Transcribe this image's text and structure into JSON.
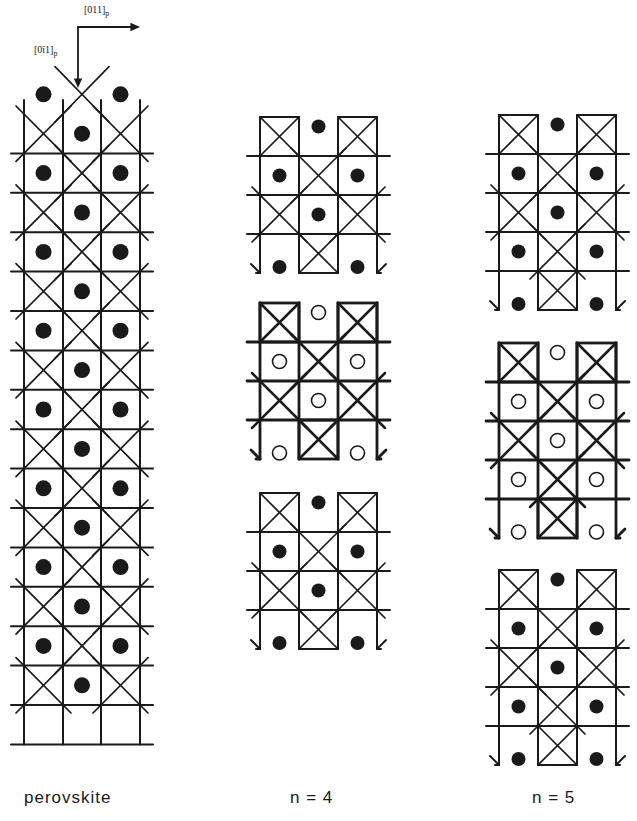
{
  "figure": {
    "axes": {
      "horizontal_label": "[011]",
      "horizontal_sub": "p",
      "vertical_label": "[0ī1]",
      "vertical_sub": "p"
    },
    "panels": [
      {
        "id": "perovskite",
        "label": "perovskite",
        "rows": 16,
        "cols": 3,
        "type": "continuous"
      },
      {
        "id": "n4",
        "label": "n = 4",
        "blocks": 3,
        "layers_per_block": 4,
        "middle_block_markers": "open"
      },
      {
        "id": "n5",
        "label": "n = 5",
        "blocks": 3,
        "layers_per_block": 5,
        "middle_block_markers": "open"
      }
    ],
    "legend_semantics": {
      "filled_circle": "A-site cation (filled)",
      "open_circle": "A-site cation (open, offset layer)",
      "crossed_square": "octahedron"
    },
    "colors": {
      "ink": "#1a1a1a",
      "background": "#ffffff"
    }
  }
}
